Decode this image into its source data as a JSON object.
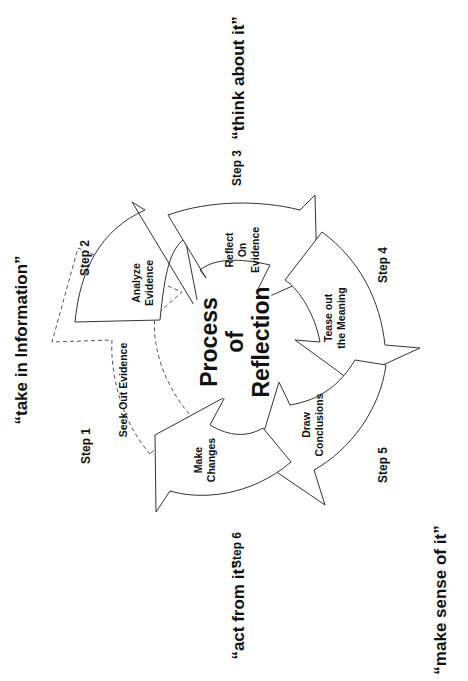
{
  "diagram": {
    "title_lines": [
      "Process",
      "of",
      "Reflection"
    ],
    "orientation": "rotated 90deg counter-clockwise",
    "quotes": {
      "top_left": "“take in Information”",
      "top_right": "“think about it”",
      "bottom_right": "“make sense of it”",
      "bottom_left": "“act from it”"
    },
    "steps": [
      {
        "label": "Step 1",
        "text_lines": [
          "Seek Out Evidence"
        ],
        "style": "dashed"
      },
      {
        "label": "Step 2",
        "text_lines": [
          "Analyze",
          "Evidence"
        ],
        "style": "solid"
      },
      {
        "label": "Step 3",
        "text_lines": [
          "Reflect",
          "On",
          "Evidence"
        ],
        "style": "solid"
      },
      {
        "label": "Step 4",
        "text_lines": [
          "Tease out",
          "the Meaning"
        ],
        "style": "solid"
      },
      {
        "label": "Step 5",
        "text_lines": [
          "Draw",
          "Conclusions"
        ],
        "style": "solid"
      },
      {
        "label": "Step 6",
        "text_lines": [
          "Make",
          "Changes"
        ],
        "style": "solid"
      }
    ],
    "colors": {
      "background": "#ffffff",
      "stroke": "#333333",
      "text": "#111111"
    }
  }
}
